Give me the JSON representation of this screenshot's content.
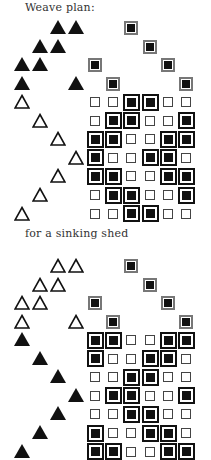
{
  "title": "Weave plan:",
  "caption": "for a sinking shed",
  "layout": {
    "grid_col_x": [
      95,
      113,
      131,
      150,
      168,
      186
    ],
    "tieup_col_x": [
      22,
      40,
      58,
      76
    ],
    "row_pitch": 18.6
  },
  "top": {
    "label": "rising shed",
    "tieup_style": "solid",
    "treadle_style": "hollow",
    "threading_y0": 28,
    "drawdown_y0": 102,
    "threading": [
      [
        3
      ],
      [
        4
      ],
      [
        1,
        5
      ],
      [
        2,
        6
      ]
    ],
    "tieup": [
      [
        3,
        4
      ],
      [
        2,
        3
      ],
      [
        1,
        2
      ],
      [
        1,
        4
      ]
    ],
    "treadling": [
      1,
      2,
      3,
      4,
      3,
      2,
      1
    ],
    "drawdown": [
      [
        0,
        0,
        1,
        1,
        0,
        0
      ],
      [
        0,
        1,
        1,
        0,
        0,
        1
      ],
      [
        1,
        1,
        0,
        0,
        1,
        1
      ],
      [
        1,
        0,
        0,
        1,
        1,
        0
      ],
      [
        1,
        1,
        0,
        0,
        1,
        1
      ],
      [
        0,
        1,
        1,
        0,
        0,
        1
      ],
      [
        0,
        0,
        1,
        1,
        0,
        0
      ]
    ]
  },
  "bottom": {
    "label": "sinking shed",
    "tieup_style": "hollow",
    "treadle_style": "solid",
    "threading_y0": 266,
    "drawdown_y0": 340,
    "threading": [
      [
        3
      ],
      [
        4
      ],
      [
        1,
        5
      ],
      [
        2,
        6
      ]
    ],
    "tieup": [
      [
        3,
        4
      ],
      [
        2,
        3
      ],
      [
        1,
        2
      ],
      [
        1,
        4
      ]
    ],
    "treadling": [
      1,
      2,
      3,
      4,
      3,
      2,
      1
    ],
    "drawdown": [
      [
        1,
        1,
        0,
        0,
        1,
        1
      ],
      [
        1,
        0,
        0,
        1,
        1,
        0
      ],
      [
        0,
        0,
        1,
        1,
        0,
        0
      ],
      [
        0,
        1,
        1,
        0,
        0,
        1
      ],
      [
        0,
        0,
        1,
        1,
        0,
        0
      ],
      [
        1,
        0,
        0,
        1,
        1,
        0
      ],
      [
        1,
        1,
        0,
        0,
        1,
        1
      ]
    ]
  }
}
